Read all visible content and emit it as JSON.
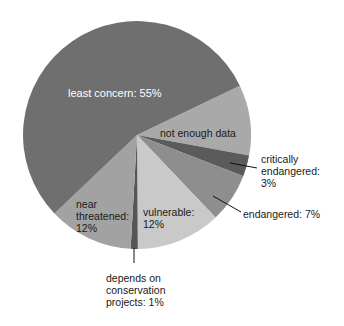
{
  "chart_data": {
    "type": "pie",
    "title": "",
    "start_angle_deg_clockwise_from_top": 64.4,
    "slices": [
      {
        "name": "not enough data",
        "value": 10,
        "color": "#a9a9a9",
        "label": "not enough data"
      },
      {
        "name": "critically endangered",
        "value": 3,
        "color": "#5b5b5b",
        "label": "critically endangered: 3%"
      },
      {
        "name": "endangered",
        "value": 7,
        "color": "#8e8e8e",
        "label": "endangered: 7%"
      },
      {
        "name": "vulnerable",
        "value": 12,
        "color": "#c9c9c9",
        "label": "vulnerable: 12%"
      },
      {
        "name": "depends on conservation projects",
        "value": 1,
        "color": "#555555",
        "label": "depends on conservation projects: 1%"
      },
      {
        "name": "near threatened",
        "value": 12,
        "color": "#a2a2a2",
        "label": "near threatened: 12%"
      },
      {
        "name": "least concern",
        "value": 55,
        "color": "#6f6f6f",
        "label": "least concern: 55%"
      }
    ],
    "legend": "none (direct labels)"
  },
  "labels": {
    "least_concern": "least concern: 55%",
    "not_enough_data": "not enough data",
    "critically_line1": "critically",
    "critically_line2": "endangered:",
    "critically_line3": "3%",
    "endangered": "endangered: 7%",
    "vulnerable_line1": "vulnerable:",
    "vulnerable_line2": "12%",
    "near_line1": "near",
    "near_line2": "threatened:",
    "near_line3": "12%",
    "depends_line1": "depends on",
    "depends_line2": "conservation",
    "depends_line3": "projects: 1%"
  }
}
